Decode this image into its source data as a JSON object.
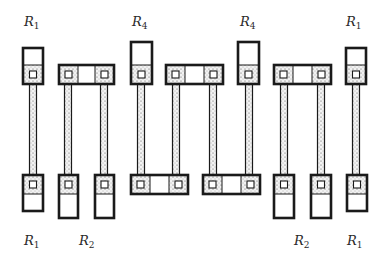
{
  "colors": {
    "stroke": "#1a1a1a",
    "dot_fill": "#f2f2f2",
    "dot_stipple": "#555555",
    "background": "#ffffff"
  },
  "labels": {
    "top": [
      {
        "id": "top-r1-left",
        "base": "R",
        "sub": "1",
        "x": 24,
        "y": 15
      },
      {
        "id": "top-r4-left",
        "base": "R",
        "sub": "4",
        "x": 132,
        "y": 15
      },
      {
        "id": "top-r4-right",
        "base": "R",
        "sub": "4",
        "x": 240,
        "y": 15
      },
      {
        "id": "top-r1-right",
        "base": "R",
        "sub": "1",
        "x": 346,
        "y": 15
      }
    ],
    "bottom": [
      {
        "id": "bottom-r1-left",
        "base": "R",
        "sub": "1",
        "x": 24,
        "y": 234
      },
      {
        "id": "bottom-r2-left",
        "base": "R",
        "sub": "2",
        "x": 79,
        "y": 234
      },
      {
        "id": "bottom-r2-right",
        "base": "R",
        "sub": "2",
        "x": 294,
        "y": 234
      },
      {
        "id": "bottom-r1-right",
        "base": "R",
        "sub": "1",
        "x": 347,
        "y": 234
      }
    ]
  },
  "pads": [
    {
      "name": "pad-top-r1-left",
      "x": 23,
      "y": 48,
      "w": 20,
      "h": 36,
      "contacts": [
        {
          "x": 23,
          "w": 20
        }
      ],
      "contact_pos": "bottom"
    },
    {
      "name": "pad-top-r2-left",
      "x": 59,
      "y": 65,
      "w": 55,
      "h": 19,
      "contacts": [
        {
          "x": 59,
          "w": 19
        },
        {
          "x": 95,
          "w": 19
        }
      ],
      "contact_pos": "full"
    },
    {
      "name": "pad-top-r4-left",
      "x": 131,
      "y": 42,
      "w": 21,
      "h": 42,
      "contacts": [
        {
          "x": 131,
          "w": 21
        }
      ],
      "contact_pos": "bottom"
    },
    {
      "name": "pad-top-middle",
      "x": 166,
      "y": 65,
      "w": 57,
      "h": 19,
      "contacts": [
        {
          "x": 166,
          "w": 19
        },
        {
          "x": 204,
          "w": 19
        }
      ],
      "contact_pos": "full"
    },
    {
      "name": "pad-top-r4-right",
      "x": 238,
      "y": 42,
      "w": 21,
      "h": 42,
      "contacts": [
        {
          "x": 238,
          "w": 21
        }
      ],
      "contact_pos": "bottom"
    },
    {
      "name": "pad-top-r2-right",
      "x": 274,
      "y": 65,
      "w": 57,
      "h": 19,
      "contacts": [
        {
          "x": 274,
          "w": 19
        },
        {
          "x": 312,
          "w": 19
        }
      ],
      "contact_pos": "full"
    },
    {
      "name": "pad-top-r1-right",
      "x": 346,
      "y": 48,
      "w": 20,
      "h": 36,
      "contacts": [
        {
          "x": 346,
          "w": 20
        }
      ],
      "contact_pos": "bottom"
    },
    {
      "name": "pad-bottom-r1-left",
      "x": 23,
      "y": 175,
      "w": 20,
      "h": 36,
      "contacts": [
        {
          "x": 23,
          "w": 20
        }
      ],
      "contact_pos": "top"
    },
    {
      "name": "pad-bottom-r2-left-a",
      "x": 59,
      "y": 175,
      "w": 19,
      "h": 43,
      "contacts": [
        {
          "x": 59,
          "w": 19
        }
      ],
      "contact_pos": "top"
    },
    {
      "name": "pad-bottom-r2-left-b",
      "x": 95,
      "y": 175,
      "w": 19,
      "h": 43,
      "contacts": [
        {
          "x": 95,
          "w": 19
        }
      ],
      "contact_pos": "top"
    },
    {
      "name": "pad-bottom-middle-left",
      "x": 131,
      "y": 175,
      "w": 57,
      "h": 19,
      "contacts": [
        {
          "x": 131,
          "w": 19
        },
        {
          "x": 169,
          "w": 19
        }
      ],
      "contact_pos": "full"
    },
    {
      "name": "pad-bottom-middle-right",
      "x": 203,
      "y": 175,
      "w": 57,
      "h": 19,
      "contacts": [
        {
          "x": 203,
          "w": 19
        },
        {
          "x": 241,
          "w": 19
        }
      ],
      "contact_pos": "full"
    },
    {
      "name": "pad-bottom-r2-right-a",
      "x": 274,
      "y": 175,
      "w": 20,
      "h": 43,
      "contacts": [
        {
          "x": 274,
          "w": 20
        }
      ],
      "contact_pos": "top"
    },
    {
      "name": "pad-bottom-r2-right-b",
      "x": 311,
      "y": 175,
      "w": 20,
      "h": 43,
      "contacts": [
        {
          "x": 311,
          "w": 20
        }
      ],
      "contact_pos": "top"
    },
    {
      "name": "pad-bottom-r1-right",
      "x": 347,
      "y": 175,
      "w": 20,
      "h": 36,
      "contacts": [
        {
          "x": 347,
          "w": 20
        }
      ],
      "contact_pos": "top"
    }
  ],
  "stems": [
    {
      "name": "stem-r1-left",
      "cx": 33
    },
    {
      "name": "stem-r2-left-a",
      "cx": 68
    },
    {
      "name": "stem-r2-left-b",
      "cx": 104
    },
    {
      "name": "stem-r4-left",
      "cx": 141
    },
    {
      "name": "stem-middle-a",
      "cx": 176
    },
    {
      "name": "stem-middle-b",
      "cx": 213
    },
    {
      "name": "stem-r4-right",
      "cx": 249
    },
    {
      "name": "stem-r2-right-a",
      "cx": 284
    },
    {
      "name": "stem-r2-right-b",
      "cx": 321
    },
    {
      "name": "stem-r1-right",
      "cx": 356
    }
  ],
  "stem_geometry": {
    "top": 84,
    "bottom": 175,
    "width": 7
  },
  "contact_height": 19
}
